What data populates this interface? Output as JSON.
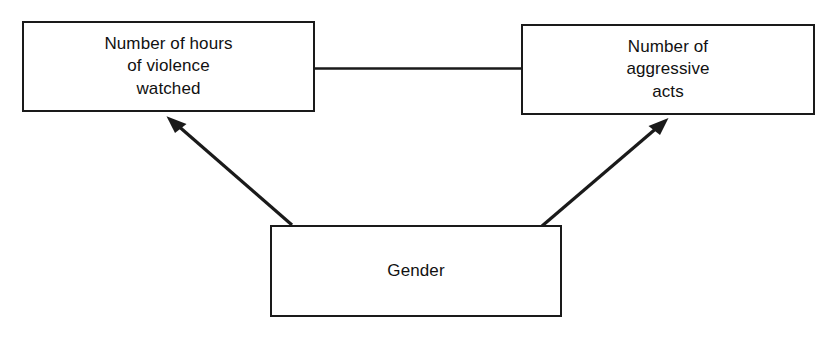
{
  "diagram": {
    "type": "path-diagram",
    "title": "",
    "background_color": "#ffffff",
    "line_color": "#1a1a1a",
    "text_color": "#111111",
    "nodes": [
      {
        "id": "hours",
        "label": "Number of hours\nof violence\nwatched",
        "x": 22,
        "y": 21,
        "width": 293,
        "height": 91
      },
      {
        "id": "aggressive",
        "label": "Number of\naggressive\nacts",
        "x": 521,
        "y": 24,
        "width": 294,
        "height": 91
      },
      {
        "id": "gender",
        "label": "Gender",
        "x": 270,
        "y": 225,
        "width": 292,
        "height": 92
      }
    ],
    "edges": [
      {
        "id": "hours-aggressive-link",
        "from": "hours",
        "to": "aggressive",
        "arrowhead": "none",
        "label": ""
      },
      {
        "id": "gender-to-hours",
        "from": "gender",
        "to": "hours",
        "arrowhead": "single",
        "label": ""
      },
      {
        "id": "gender-to-aggressive",
        "from": "gender",
        "to": "aggressive",
        "arrowhead": "single",
        "label": ""
      }
    ]
  }
}
